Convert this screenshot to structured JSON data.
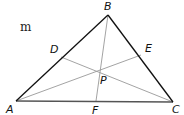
{
  "figure": {
    "type": "triangle-with-cevians",
    "fragment_text": "m",
    "colors": {
      "side": "#111111",
      "base": "#555555",
      "cevian": "#999999",
      "label": "#111111"
    },
    "points": {
      "A": {
        "label": "A",
        "x": 16,
        "y": 101
      },
      "B": {
        "label": "B",
        "x": 108,
        "y": 15
      },
      "C": {
        "label": "C",
        "x": 173,
        "y": 102
      },
      "D": {
        "label": "D",
        "x": 61,
        "y": 57
      },
      "E": {
        "label": "E",
        "x": 141,
        "y": 55
      },
      "F": {
        "label": "F",
        "x": 96,
        "y": 101
      },
      "P": {
        "label": "P",
        "x": 97,
        "y": 90
      }
    },
    "label_positions": {
      "A": {
        "x": 6,
        "y": 113
      },
      "B": {
        "x": 104,
        "y": 10
      },
      "C": {
        "x": 172,
        "y": 113
      },
      "D": {
        "x": 50,
        "y": 53
      },
      "E": {
        "x": 145,
        "y": 52
      },
      "F": {
        "x": 92,
        "y": 114
      },
      "P": {
        "x": 100,
        "y": 84
      }
    },
    "segments": [
      {
        "from": "A",
        "to": "B",
        "kind": "side"
      },
      {
        "from": "B",
        "to": "C",
        "kind": "side"
      },
      {
        "from": "A",
        "to": "C",
        "kind": "base"
      },
      {
        "from": "B",
        "to": "F",
        "kind": "cevian"
      },
      {
        "from": "C",
        "to": "D",
        "kind": "cevian"
      },
      {
        "from": "A",
        "to": "E",
        "kind": "cevian"
      }
    ]
  }
}
